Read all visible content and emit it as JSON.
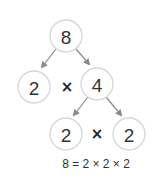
{
  "diagram": {
    "type": "factor-tree",
    "root": {
      "label": "8"
    },
    "level1": {
      "left": {
        "label": "2"
      },
      "operator": "×",
      "right": {
        "label": "4"
      }
    },
    "level2": {
      "left": {
        "label": "2"
      },
      "operator": "×",
      "right": {
        "label": "2"
      }
    },
    "equation": "8 = 2 × 2 × 2",
    "colors": {
      "circle_stroke": "#d6d6d6",
      "arrow": "#8a8a8a",
      "text": "#333333"
    }
  }
}
